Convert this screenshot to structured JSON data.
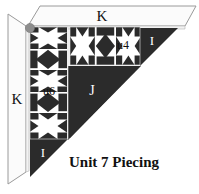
{
  "figure": {
    "caption": "Unit 7 Piecing",
    "colors": {
      "fabric_dark": "#2b2b2b",
      "fabric_light": "#ffffff",
      "frame_line": "#8a8a8a",
      "frame_fill": "#fbfbfb",
      "corner_dot": "#8d8d8d",
      "background": "#ffffff"
    },
    "labels": {
      "k_top": "K",
      "k_left": "K",
      "u4": "u4",
      "u6": "u6",
      "i_right": "I",
      "i_bottom": "I",
      "j": "J"
    },
    "pieces": [
      {
        "name": "K border strip (top)",
        "label": "K"
      },
      {
        "name": "K border strip (left)",
        "label": "K"
      },
      {
        "name": "pieced strip horizontal",
        "label": "u4"
      },
      {
        "name": "pieced strip vertical",
        "label": "u6"
      },
      {
        "name": "corner triangle right",
        "label": "I"
      },
      {
        "name": "corner triangle bottom",
        "label": "I"
      },
      {
        "name": "large setting triangle",
        "label": "J"
      }
    ],
    "strips": {
      "vertical_u6_blocks": [
        "star",
        "diamond",
        "star",
        "diamond",
        "star"
      ],
      "horizontal_u4_blocks": [
        "star",
        "diamond",
        "star"
      ]
    }
  }
}
